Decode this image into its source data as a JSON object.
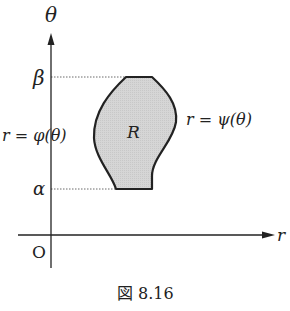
{
  "figure": {
    "caption": "図 8.16",
    "axes": {
      "vertical_label": "θ",
      "horizontal_label": "r",
      "origin_label": "O"
    },
    "levels": {
      "upper_label": "β",
      "lower_label": "α"
    },
    "region": {
      "label": "R",
      "fill_color": "#d4d4d4",
      "stroke_color": "#222222"
    },
    "curves": {
      "left_label": "r = φ(θ)",
      "right_label": "r = ψ(θ)"
    }
  }
}
